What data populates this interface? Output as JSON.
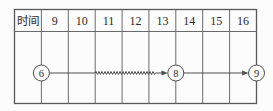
{
  "figure": {
    "header_label": "时间",
    "time_columns": [
      "9",
      "10",
      "11",
      "12",
      "13",
      "14",
      "15",
      "16"
    ],
    "nodes": [
      {
        "label": "6"
      },
      {
        "label": "8"
      },
      {
        "label": "9"
      }
    ],
    "edges": [
      {
        "from": "6",
        "to": "8",
        "style": "solid-with-wavy-middle",
        "arrow": true
      },
      {
        "from": "8",
        "to": "9",
        "style": "solid",
        "arrow": true
      }
    ]
  },
  "colors": {
    "background": "#fcfcfc",
    "grid_line": "#6a6a6a",
    "connector_line": "#4f4f4f",
    "text": "#2b2b2b"
  }
}
